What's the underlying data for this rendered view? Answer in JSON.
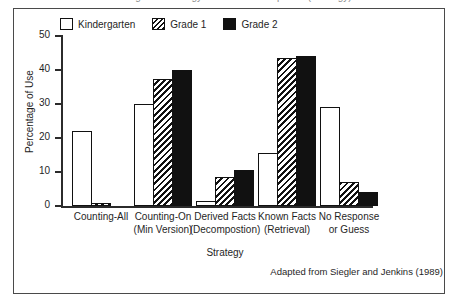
{
  "figure": {
    "title_cutoff": "Changes in Strategy Use with Development (Strategy)",
    "caption": "Adapted from Siegler and Jenkins (1989)"
  },
  "legend": {
    "position": "top",
    "entries": [
      {
        "label": "Kindergarten",
        "style": "open",
        "swatch": "white-outline-swatch"
      },
      {
        "label": "Grade 1",
        "style": "hatch",
        "swatch": "diagonal-hatch-swatch"
      },
      {
        "label": "Grade 2",
        "style": "solid",
        "swatch": "solid-black-swatch"
      }
    ]
  },
  "axes": {
    "ylabel": "Percentage of Use",
    "xlabel": "Strategy",
    "yticks": [
      0,
      10,
      20,
      30,
      40,
      50
    ],
    "ylim": [
      0,
      50
    ]
  },
  "chart_data": {
    "type": "bar",
    "title": "Changes in Strategy Use with Development",
    "xlabel": "Strategy",
    "ylabel": "Percentage of Use",
    "ylim": [
      0,
      50
    ],
    "yticks": [
      0,
      10,
      20,
      30,
      40,
      50
    ],
    "grid": false,
    "legend_position": "top",
    "categories": [
      "Counting-All",
      "Counting-On (Min Version)",
      "Derived Facts (Decompostion)",
      "Known Facts (Retrieval)",
      "No Response or Guess"
    ],
    "category_lines": [
      [
        "Counting-All",
        ""
      ],
      [
        "Counting-On",
        "(Min Version)"
      ],
      [
        "Derived Facts",
        "(Decompostion)"
      ],
      [
        "Known Facts",
        "(Retrieval)"
      ],
      [
        "No Response",
        "or Guess"
      ]
    ],
    "series": [
      {
        "name": "Kindergarten",
        "values": [
          22,
          30,
          1.5,
          15.5,
          29
        ]
      },
      {
        "name": "Grade 1",
        "values": [
          1,
          37.5,
          8.5,
          43.5,
          7
        ]
      },
      {
        "name": "Grade 2",
        "values": [
          0,
          40,
          10.5,
          44,
          4
        ]
      }
    ],
    "annotations": [
      "Adapted from Siegler and Jenkins (1989)"
    ]
  }
}
